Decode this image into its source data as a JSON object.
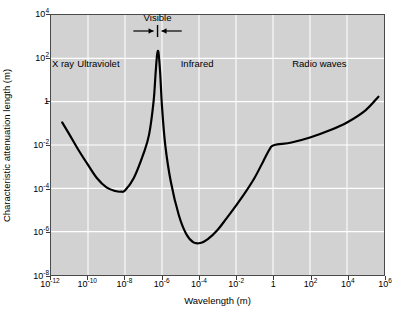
{
  "chart_data": {
    "type": "line",
    "title": "",
    "xlabel": "Wavelength (m)",
    "ylabel": "Characteristic attenuation length (m)",
    "xscale": "log",
    "yscale": "log",
    "xlim": [
      1e-12,
      1000000.0
    ],
    "ylim": [
      1e-08,
      10000.0
    ],
    "grid": true,
    "legend": "none",
    "xticks": [
      {
        "value": 1e-12,
        "mantissa": "10",
        "exponent": "-12"
      },
      {
        "value": 1e-10,
        "mantissa": "10",
        "exponent": "-10"
      },
      {
        "value": 1e-08,
        "mantissa": "10",
        "exponent": "-8"
      },
      {
        "value": 1e-06,
        "mantissa": "10",
        "exponent": "-6"
      },
      {
        "value": 0.0001,
        "mantissa": "10",
        "exponent": "-4"
      },
      {
        "value": 0.01,
        "mantissa": "10",
        "exponent": "-2"
      },
      {
        "value": 1,
        "mantissa": "1",
        "exponent": ""
      },
      {
        "value": 100.0,
        "mantissa": "10",
        "exponent": "2"
      },
      {
        "value": 10000.0,
        "mantissa": "10",
        "exponent": "4"
      },
      {
        "value": 1000000.0,
        "mantissa": "10",
        "exponent": "6"
      }
    ],
    "yticks": [
      {
        "value": 10000.0,
        "mantissa": "10",
        "exponent": "4"
      },
      {
        "value": 100.0,
        "mantissa": "10",
        "exponent": "2"
      },
      {
        "value": 1,
        "mantissa": "1",
        "exponent": ""
      },
      {
        "value": 0.01,
        "mantissa": "10",
        "exponent": "-2"
      },
      {
        "value": 0.0001,
        "mantissa": "10",
        "exponent": "-4"
      },
      {
        "value": 1e-06,
        "mantissa": "10",
        "exponent": "-6"
      },
      {
        "value": 1e-08,
        "mantissa": "10",
        "exponent": "-8"
      }
    ],
    "series": [
      {
        "name": "Characteristic attenuation length",
        "color": "#000000",
        "linewidth": 2.2,
        "points": [
          [
            4e-12,
            0.11
          ],
          [
            1e-11,
            0.03
          ],
          [
            3e-11,
            0.006
          ],
          [
            1e-10,
            0.0012
          ],
          [
            3e-10,
            0.0003
          ],
          [
            1e-09,
            0.00011
          ],
          [
            3e-09,
            7.5e-05
          ],
          [
            6e-09,
            7e-05
          ],
          [
            1e-08,
            8e-05
          ],
          [
            3e-08,
            0.0003
          ],
          [
            1e-07,
            0.004
          ],
          [
            2e-07,
            0.03
          ],
          [
            3.5e-07,
            1.0
          ],
          [
            4.5e-07,
            20.0
          ],
          [
            5.5e-07,
            160.0
          ],
          [
            6.5e-07,
            180.0
          ],
          [
            8e-07,
            20.0
          ],
          [
            1e-06,
            0.6
          ],
          [
            1.5e-06,
            0.01
          ],
          [
            3e-06,
            0.0002
          ],
          [
            8e-06,
            6e-06
          ],
          [
            2e-05,
            8e-07
          ],
          [
            5e-05,
            3.2e-07
          ],
          [
            0.00012,
            3e-07
          ],
          [
            0.0003,
            4.5e-07
          ],
          [
            0.001,
            1.2e-06
          ],
          [
            0.003,
            4e-06
          ],
          [
            0.01,
            1.6e-05
          ],
          [
            0.03,
            6e-05
          ],
          [
            0.1,
            0.0003
          ],
          [
            0.3,
            0.0018
          ],
          [
            0.7,
            0.007
          ],
          [
            1.2,
            0.01
          ],
          [
            10.0,
            0.013
          ],
          [
            100.0,
            0.022
          ],
          [
            1000.0,
            0.045
          ],
          [
            10000.0,
            0.11
          ],
          [
            100000.0,
            0.4
          ],
          [
            500000.0,
            1.7
          ]
        ]
      }
    ],
    "band_labels": [
      {
        "name": "x-ray",
        "text": "X ray",
        "x_center": 5e-12,
        "y_pos": 50.0
      },
      {
        "name": "ultraviolet",
        "text": "Ultraviolet",
        "x_center": 4e-10,
        "y_pos": 50.0
      },
      {
        "name": "infrared",
        "text": "Infrared",
        "x_center": 8e-05,
        "y_pos": 50.0
      },
      {
        "name": "radio-waves",
        "text": "Radio waves",
        "x_center": 300.0,
        "y_pos": 50.0
      }
    ],
    "annotations": [
      {
        "name": "visible-band",
        "label": "Visible",
        "x_center": 6e-07,
        "x_left_arrow_from": 3e-08,
        "x_right_arrow_from": 1.2e-05,
        "marker": "vertical-tick-with-inward-arrows"
      }
    ]
  },
  "style": {
    "plot_background": "#d2d2d2",
    "gridline_color": "#ffffff",
    "axis_color": "#4a4a4a",
    "curve_color": "#000000",
    "text_color": "#000000",
    "page_background": "#ffffff"
  }
}
